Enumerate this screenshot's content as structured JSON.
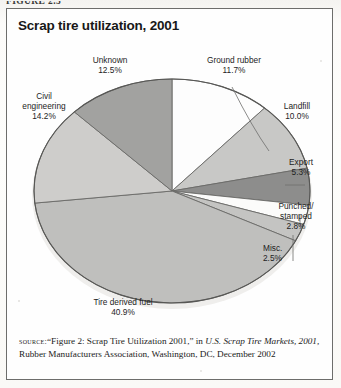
{
  "figure": {
    "label": "FIGURE 2.5"
  },
  "chart_title": "Scrap tire utilization, 2001",
  "chart_data": {
    "type": "pie",
    "title": "Scrap tire utilization, 2001",
    "xlabel": "",
    "ylabel": "",
    "legend": "none",
    "categories": [
      "Ground rubber",
      "Landfill",
      "Export",
      "Punched/stamped",
      "Misc.",
      "Tire derived fuel",
      "Civil engineering",
      "Unknown"
    ],
    "values": [
      11.7,
      10.0,
      5.3,
      2.8,
      2.5,
      40.9,
      14.2,
      12.5
    ],
    "unit": "%",
    "slices": [
      {
        "label": "Ground rubber",
        "value": 11.7,
        "value_text": "11.7%",
        "color": "#fdfdfd"
      },
      {
        "label": "Landfill",
        "value": 10.0,
        "value_text": "10.0%",
        "color": "#c8c8c6"
      },
      {
        "label": "Export",
        "value": 5.3,
        "value_text": "5.3%",
        "color": "#8d8d8c"
      },
      {
        "label": "Punched/stamped",
        "value": 2.8,
        "value_text": "2.8%",
        "color": "#fbfbfa"
      },
      {
        "label": "Misc.",
        "value": 2.5,
        "value_text": "2.5%",
        "color": "#c4c4c2"
      },
      {
        "label": "Tire derived fuel",
        "value": 40.9,
        "value_text": "40.9%",
        "color": "#bfbfbd"
      },
      {
        "label": "Civil engineering",
        "value": 14.2,
        "value_text": "14.2%",
        "color": "#cecdcb"
      },
      {
        "label": "Unknown",
        "value": 12.5,
        "value_text": "12.5%",
        "color": "#a2a2a0"
      }
    ]
  },
  "labels": {
    "ground_rubber_name": "Ground rubber",
    "ground_rubber_pct": "11.7%",
    "landfill_name": "Landfill",
    "landfill_pct": "10.0%",
    "export_name": "Export",
    "export_pct": "5.3%",
    "punched_name_line1": "Punched/",
    "punched_name_line2": "stamped",
    "punched_pct": "2.8%",
    "misc_name": "Misc.",
    "misc_pct": "2.5%",
    "tdf_name": "Tire derived fuel",
    "tdf_pct": "40.9%",
    "civil_name_line1": "Civil",
    "civil_name_line2": "engineering",
    "civil_pct": "14.2%",
    "unknown_name": "Unknown",
    "unknown_pct": "12.5%"
  },
  "source": {
    "keyword": "source:",
    "part1": "“Figure 2: Scrap Tire Utilization 2001,” in ",
    "italic1": "U.S. Scrap Tire Markets, 2001,",
    "part2": " Rubber Manufacturers Association, Washington, DC, December 2002"
  }
}
